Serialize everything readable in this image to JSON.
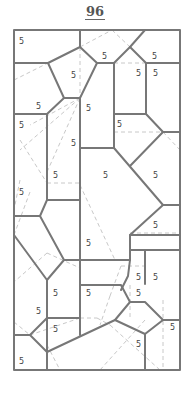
{
  "page_number": "96",
  "puzzle": {
    "frame": {
      "x": 14,
      "y": 30,
      "width": 166,
      "height": 340
    },
    "line_color": "#777777",
    "dash_color": "#c8c8c8",
    "cell_labels": [
      {
        "text": "5",
        "x": 19,
        "y": 41
      },
      {
        "text": "5",
        "x": 102,
        "y": 56
      },
      {
        "text": "5",
        "x": 152,
        "y": 56
      },
      {
        "text": "5",
        "x": 71,
        "y": 76
      },
      {
        "text": "5",
        "x": 136,
        "y": 76
      },
      {
        "text": "5",
        "x": 153,
        "y": 76
      },
      {
        "text": "5",
        "x": 36,
        "y": 106
      },
      {
        "text": "5",
        "x": 86,
        "y": 109
      },
      {
        "text": "5",
        "x": 19,
        "y": 125
      },
      {
        "text": "5",
        "x": 117,
        "y": 125
      },
      {
        "text": "5",
        "x": 71,
        "y": 143
      },
      {
        "text": "5",
        "x": 52,
        "y": 177
      },
      {
        "text": "5",
        "x": 103,
        "y": 177
      },
      {
        "text": "5",
        "x": 153,
        "y": 177
      },
      {
        "text": "5",
        "x": 19,
        "y": 195
      },
      {
        "text": "5",
        "x": 153,
        "y": 228
      },
      {
        "text": "5",
        "x": 86,
        "y": 245
      },
      {
        "text": "5",
        "x": 136,
        "y": 280
      },
      {
        "text": "5",
        "x": 153,
        "y": 280
      },
      {
        "text": "5",
        "x": 136,
        "y": 296
      },
      {
        "text": "5",
        "x": 52,
        "y": 296
      },
      {
        "text": "5",
        "x": 86,
        "y": 296
      },
      {
        "text": "5",
        "x": 36,
        "y": 313
      },
      {
        "text": "5",
        "x": 171,
        "y": 328
      },
      {
        "text": "5",
        "x": 52,
        "y": 332
      },
      {
        "text": "5",
        "x": 136,
        "y": 345
      },
      {
        "text": "5",
        "x": 19,
        "y": 362
      }
    ]
  }
}
